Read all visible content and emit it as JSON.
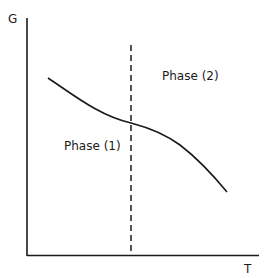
{
  "diagram": {
    "type": "phase-free-energy-vs-temperature",
    "y_axis": {
      "label": "G"
    },
    "x_axis": {
      "label": "T"
    },
    "regions": [
      {
        "label": "Phase (1)",
        "side": "left of transition"
      },
      {
        "label": "Phase (2)",
        "side": "right of transition"
      }
    ],
    "transition_line": {
      "style": "dashed",
      "orientation": "vertical"
    },
    "curve": {
      "description": "G decreases with T; curve slope changes at the transition temperature",
      "points_px": [
        [
          48,
          78
        ],
        [
          90,
          104
        ],
        [
          131,
          123
        ],
        [
          163,
          134
        ],
        [
          200,
          163
        ],
        [
          227,
          192
        ]
      ]
    },
    "colors": {
      "line": "#1a1a1a",
      "background": "#ffffff"
    }
  }
}
